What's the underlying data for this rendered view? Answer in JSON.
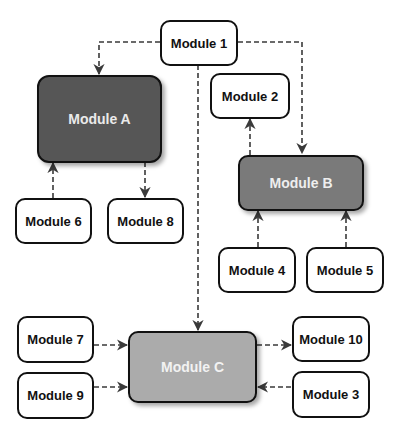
{
  "diagram": {
    "type": "module-dependency-diagram",
    "nodes": [
      {
        "id": "m1",
        "label": "Module 1",
        "style": "plain"
      },
      {
        "id": "mA",
        "label": "Module A",
        "style": "dark",
        "fill": "#565656"
      },
      {
        "id": "m2",
        "label": "Module 2",
        "style": "plain"
      },
      {
        "id": "mB",
        "label": "Module B",
        "style": "mid",
        "fill": "#7a7a7a"
      },
      {
        "id": "m6",
        "label": "Module 6",
        "style": "plain"
      },
      {
        "id": "m8",
        "label": "Module 8",
        "style": "plain"
      },
      {
        "id": "m4",
        "label": "Module 4",
        "style": "plain"
      },
      {
        "id": "m5",
        "label": "Module 5",
        "style": "plain"
      },
      {
        "id": "m7",
        "label": "Module 7",
        "style": "plain"
      },
      {
        "id": "m9",
        "label": "Module 9",
        "style": "plain"
      },
      {
        "id": "mC",
        "label": "Module C",
        "style": "light",
        "fill": "#ababab"
      },
      {
        "id": "m10",
        "label": "Module 10",
        "style": "plain"
      },
      {
        "id": "m3",
        "label": "Module 3",
        "style": "plain"
      }
    ],
    "edges": [
      {
        "from": "Module 1",
        "to": "Module A",
        "style": "dashed"
      },
      {
        "from": "Module 1",
        "to": "Module B",
        "style": "dashed"
      },
      {
        "from": "Module 1",
        "to": "Module C",
        "style": "dashed"
      },
      {
        "from": "Module B",
        "to": "Module 2",
        "style": "dashed"
      },
      {
        "from": "Module 6",
        "to": "Module A",
        "style": "dashed"
      },
      {
        "from": "Module A",
        "to": "Module 8",
        "style": "dashed"
      },
      {
        "from": "Module 4",
        "to": "Module B",
        "style": "dashed"
      },
      {
        "from": "Module 5",
        "to": "Module B",
        "style": "dashed"
      },
      {
        "from": "Module 7",
        "to": "Module C",
        "style": "dashed"
      },
      {
        "from": "Module 9",
        "to": "Module C",
        "style": "dashed"
      },
      {
        "from": "Module C",
        "to": "Module 10",
        "style": "dashed"
      },
      {
        "from": "Module 3",
        "to": "Module C",
        "style": "dashed"
      }
    ],
    "colors": {
      "edge": "#3a3a3a",
      "border": "#111111",
      "module_a": "#565656",
      "module_b": "#7a7a7a",
      "module_c": "#ababab"
    }
  }
}
